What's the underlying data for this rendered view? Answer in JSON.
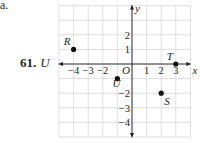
{
  "header": {
    "part_label": "a."
  },
  "problem": {
    "number": "61.",
    "variable": "U"
  },
  "chart_data": {
    "type": "scatter",
    "title": "",
    "xlabel": "x",
    "ylabel": "y",
    "origin_label": "O",
    "xlim": [
      -5,
      4
    ],
    "ylim": [
      -5,
      4
    ],
    "grid": true,
    "x_ticks": [
      {
        "value": -4,
        "label": "−4"
      },
      {
        "value": -3,
        "label": "−3"
      },
      {
        "value": -2,
        "label": "−2"
      },
      {
        "value": 1,
        "label": "1"
      },
      {
        "value": 2,
        "label": "2"
      },
      {
        "value": 3,
        "label": "3"
      }
    ],
    "y_ticks": [
      {
        "value": 2,
        "label": "2"
      },
      {
        "value": 1,
        "label": "1"
      },
      {
        "value": -2,
        "label": "−2"
      },
      {
        "value": -3,
        "label": "−3"
      },
      {
        "value": -4,
        "label": "−4"
      }
    ],
    "points": [
      {
        "name": "R",
        "x": -4,
        "y": 1,
        "label_pos": "upper-left"
      },
      {
        "name": "T",
        "x": 3,
        "y": 0,
        "label_pos": "upper-left"
      },
      {
        "name": "U",
        "x": -1,
        "y": -1,
        "label_pos": "lower-left"
      },
      {
        "name": "S",
        "x": 2,
        "y": -2,
        "label_pos": "lower-right"
      }
    ]
  }
}
